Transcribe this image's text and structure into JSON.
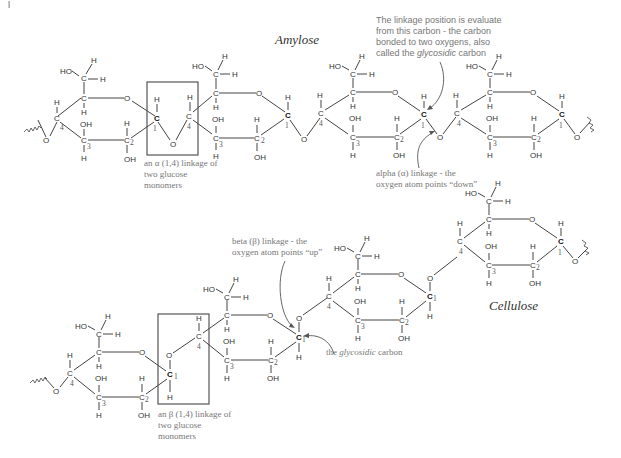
{
  "panel_marker": "|",
  "amylose": {
    "title": "Amylose",
    "box_caption": [
      "an α (1,4) linkage of",
      "two glucose",
      "monomers"
    ],
    "glycosidic_note": [
      "The linkage position is evaluate",
      "from this carbon - the carbon",
      "bonded to two oxygens, also"
    ],
    "glycosidic_note_last": {
      "pre": "called the ",
      "em": "glycosidic",
      "post": " carbon"
    },
    "alpha_note": [
      "alpha (α) linkage - the",
      "oxygen atom points “down”"
    ]
  },
  "cellulose": {
    "title": "Cellulose",
    "box_caption": [
      "an β (1,4) linkage of",
      "two glucose",
      "monomers"
    ],
    "beta_note": [
      "beta (β) linkage - the",
      "oxygen atom points “up”"
    ],
    "glycosidic_label": {
      "pre": "the ",
      "em": "glycosidic",
      "post": " carbon"
    }
  },
  "atoms": {
    "C": "C",
    "O": "O",
    "H": "H",
    "OH": "OH",
    "HO": "HO",
    "n1": "1",
    "n2": "2",
    "n3": "3",
    "n4": "4"
  }
}
